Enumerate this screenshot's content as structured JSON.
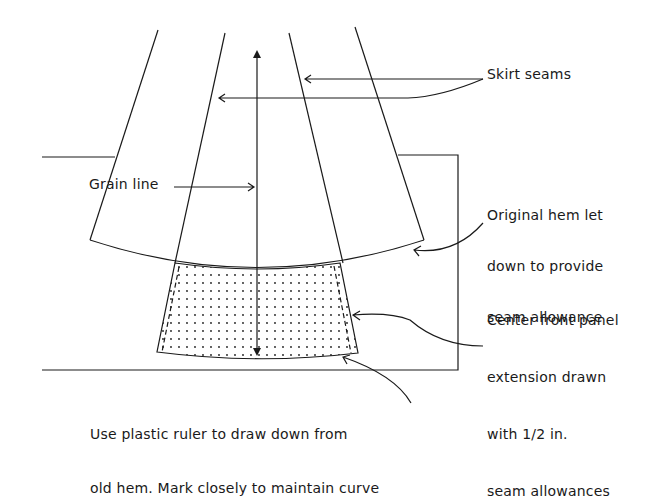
{
  "diagram": {
    "colors": {
      "ink": "#1a1a1a",
      "background": "#ffffff"
    },
    "labels": {
      "skirt_seams": "Skirt seams",
      "grain_line": "Grain line",
      "original_hem": [
        "Original hem let",
        "down to provide",
        "seam allowance"
      ],
      "center_front": [
        "Center front panel",
        "extension drawn",
        "with 1/2 in.",
        "seam allowances"
      ],
      "ruler_note": [
        "Use plastic ruler to draw down from",
        "old hem. Mark closely to maintain curve"
      ]
    }
  }
}
